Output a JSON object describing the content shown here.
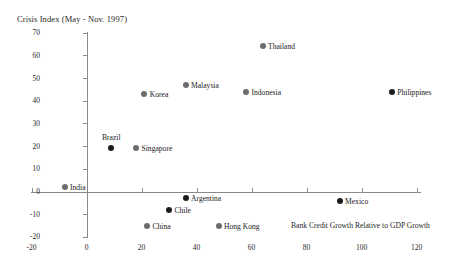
{
  "chart_data": {
    "type": "scatter",
    "title": "",
    "ylabel": "Crisis Index (May - Nov. 1997)",
    "xlabel": "Bank Credit Growth Relative to GDP Growth",
    "xlim": [
      -20,
      120
    ],
    "ylim": [
      -20,
      70
    ],
    "xticks": [
      -20,
      0,
      20,
      40,
      60,
      80,
      100,
      120
    ],
    "yticks": [
      -20,
      -10,
      0,
      10,
      20,
      30,
      40,
      50,
      60,
      70
    ],
    "xtick_labels": [
      "-20",
      "0",
      "20",
      "40",
      "60",
      "80",
      "100",
      "120"
    ],
    "ytick_labels": [
      "-20",
      "-10",
      "0",
      "10",
      "20",
      "30",
      "40",
      "50",
      "60",
      "70"
    ],
    "grid": false,
    "legend": "none",
    "points": [
      {
        "label": "India",
        "x": -8,
        "y": 2,
        "shade": "gray",
        "label_pos": "right"
      },
      {
        "label": "Brazil",
        "x": 9,
        "y": 19,
        "shade": "dark",
        "label_pos": "above"
      },
      {
        "label": "Singapore",
        "x": 18,
        "y": 19,
        "shade": "gray",
        "label_pos": "right"
      },
      {
        "label": "Korea",
        "x": 21,
        "y": 43,
        "shade": "gray",
        "label_pos": "right"
      },
      {
        "label": "China",
        "x": 22,
        "y": -15,
        "shade": "gray",
        "label_pos": "right"
      },
      {
        "label": "Chile",
        "x": 30,
        "y": -8,
        "shade": "dark",
        "label_pos": "right"
      },
      {
        "label": "Malaysia",
        "x": 36,
        "y": 47,
        "shade": "gray",
        "label_pos": "right"
      },
      {
        "label": "Argentina",
        "x": 36,
        "y": -3,
        "shade": "dark",
        "label_pos": "right"
      },
      {
        "label": "Hong Kong",
        "x": 48,
        "y": -15,
        "shade": "gray",
        "label_pos": "right"
      },
      {
        "label": "Indonesia",
        "x": 58,
        "y": 44,
        "shade": "gray",
        "label_pos": "right"
      },
      {
        "label": "Thailand",
        "x": 64,
        "y": 64,
        "shade": "gray",
        "label_pos": "right"
      },
      {
        "label": "Mexico",
        "x": 92,
        "y": -4,
        "shade": "dark",
        "label_pos": "right"
      },
      {
        "label": "Philippines",
        "x": 111,
        "y": 44,
        "shade": "dark",
        "label_pos": "right"
      }
    ]
  }
}
